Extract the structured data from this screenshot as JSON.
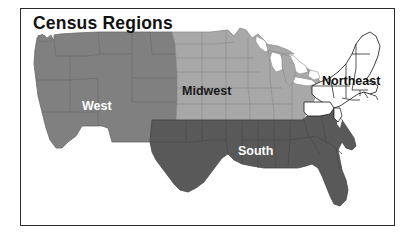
{
  "figure": {
    "title": "Census Regions",
    "frame": {
      "border_color": "#2b2b2b",
      "background": "#ffffff"
    }
  },
  "map": {
    "subject": "United States census regions",
    "regions": [
      {
        "key": "west",
        "label": "West",
        "fill": "#808080",
        "label_color": "#ffffff",
        "border": "#6b6b6b"
      },
      {
        "key": "midwest",
        "label": "Midwest",
        "fill": "#a8a8a8",
        "label_color": "#1a1a1a",
        "border": "#8d8d8d"
      },
      {
        "key": "south",
        "label": "South",
        "fill": "#595959",
        "label_color": "#ffffff",
        "border": "#474747"
      },
      {
        "key": "northeast",
        "label": "Northeast",
        "fill": "#ffffff",
        "label_color": "#111111",
        "border": "#2b2b2b"
      }
    ],
    "water": {
      "name": "Great Lakes",
      "fill": "#ffffff"
    }
  }
}
